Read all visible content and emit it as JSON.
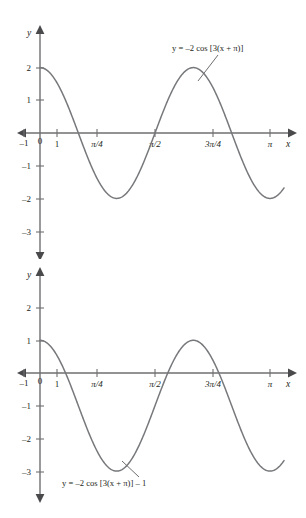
{
  "figures": [
    {
      "id": "figure-1",
      "equation_label": "y = –2 cos [3(x + π)]",
      "axis_x_name": "x",
      "axis_y_name": "y",
      "x_ticks": [
        {
          "label": "–1",
          "value": -1
        },
        {
          "label": "0",
          "value": 0
        },
        {
          "label": "1",
          "value": 1
        },
        {
          "label": "π/4",
          "value": 0.7853981634
        },
        {
          "label": "π/2",
          "value": 1.5707963268
        },
        {
          "label": "3π/4",
          "value": 2.3561944902
        },
        {
          "label": "π",
          "value": 3.1415926536
        }
      ],
      "y_ticks": [
        {
          "label": "2",
          "value": 2
        },
        {
          "label": "1",
          "value": 1
        },
        {
          "label": "–1",
          "value": -1
        },
        {
          "label": "–2",
          "value": -2
        },
        {
          "label": "–3",
          "value": -3
        }
      ],
      "chart_data": {
        "type": "line",
        "title": "",
        "xlabel": "x",
        "ylabel": "y",
        "expression": "y = -2*cos(3*(x + pi))",
        "amplitude": 2,
        "vertical_shift": 0,
        "period": 2.0943951024,
        "xlim": [
          -0.25,
          3.35
        ],
        "ylim": [
          -3.6,
          2.9
        ],
        "grid": false,
        "legend": "none",
        "annotations": [
          {
            "text": "y = –2 cos [3(x + π)]",
            "x": 2.45,
            "y": 2.62
          }
        ],
        "series": [
          {
            "name": "y = -2 cos [3(x + pi)]",
            "x": [
              0,
              0.105,
              0.209,
              0.314,
              0.419,
              0.524,
              0.628,
              0.733,
              0.838,
              0.942,
              1.047,
              1.152,
              1.257,
              1.361,
              1.466,
              1.571,
              1.676,
              1.78,
              1.885,
              1.99,
              2.094,
              2.199,
              2.304,
              2.409,
              2.513,
              2.618,
              2.723,
              2.827,
              2.932,
              3.037,
              3.142
            ],
            "y": [
              2.0,
              1.902,
              1.618,
              1.176,
              0.618,
              0.0,
              -0.618,
              -1.176,
              -1.618,
              -1.902,
              -2.0,
              -1.902,
              -1.618,
              -1.176,
              -0.618,
              0.0,
              0.618,
              1.176,
              1.618,
              1.902,
              2.0,
              1.902,
              1.618,
              1.176,
              0.618,
              0.0,
              -0.618,
              -1.176,
              -1.618,
              -1.902,
              -2.0
            ]
          }
        ]
      }
    },
    {
      "id": "figure-2",
      "equation_label": "y = –2 cos [3(x + π)] – 1",
      "axis_x_name": "x",
      "axis_y_name": "y",
      "x_ticks": [
        {
          "label": "–1",
          "value": -1
        },
        {
          "label": "0",
          "value": 0
        },
        {
          "label": "1",
          "value": 1
        },
        {
          "label": "π/4",
          "value": 0.7853981634
        },
        {
          "label": "π/2",
          "value": 1.5707963268
        },
        {
          "label": "3π/4",
          "value": 2.3561944902
        },
        {
          "label": "π",
          "value": 3.1415926536
        }
      ],
      "y_ticks": [
        {
          "label": "2",
          "value": 2
        },
        {
          "label": "1",
          "value": 1
        },
        {
          "label": "–1",
          "value": -1
        },
        {
          "label": "–2",
          "value": -2
        },
        {
          "label": "–3",
          "value": -3
        }
      ],
      "chart_data": {
        "type": "line",
        "title": "",
        "xlabel": "x",
        "ylabel": "y",
        "expression": "y = -2*cos(3*(x + pi)) - 1",
        "amplitude": 2,
        "vertical_shift": -1,
        "period": 2.0943951024,
        "xlim": [
          -0.25,
          3.35
        ],
        "ylim": [
          -3.6,
          2.9
        ],
        "grid": false,
        "legend": "none",
        "annotations": [
          {
            "text": "y = –2 cos [3(x + π)] – 1",
            "x": 0.9,
            "y": -3.35
          }
        ],
        "series": [
          {
            "name": "y = -2 cos [3(x + pi)] - 1",
            "x": [
              0,
              0.105,
              0.209,
              0.314,
              0.419,
              0.524,
              0.628,
              0.733,
              0.838,
              0.942,
              1.047,
              1.152,
              1.257,
              1.361,
              1.466,
              1.571,
              1.676,
              1.78,
              1.885,
              1.99,
              2.094,
              2.199,
              2.304,
              2.409,
              2.513,
              2.618,
              2.723,
              2.827,
              2.932,
              3.037,
              3.142
            ],
            "y": [
              1.0,
              0.902,
              0.618,
              0.176,
              -0.382,
              -1.0,
              -1.618,
              -2.176,
              -2.618,
              -2.902,
              -3.0,
              -2.902,
              -2.618,
              -2.176,
              -1.618,
              -1.0,
              -0.382,
              0.176,
              0.618,
              0.902,
              1.0,
              0.902,
              0.618,
              0.176,
              -0.382,
              -1.0,
              -1.618,
              -2.176,
              -2.618,
              -2.902,
              -3.0
            ]
          }
        ]
      }
    }
  ]
}
